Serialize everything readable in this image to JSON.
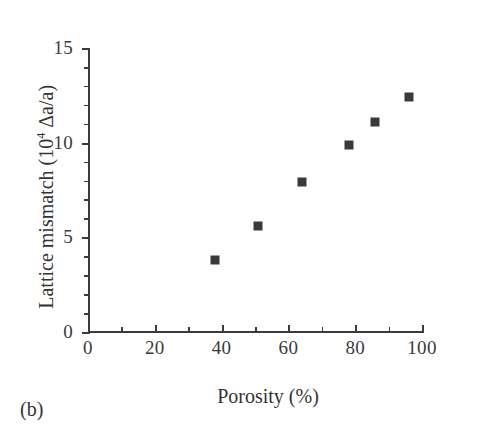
{
  "panel": {
    "label": "(b)"
  },
  "chart_data": {
    "type": "scatter",
    "title": "",
    "xlabel": "Porosity (%)",
    "ylabel": "Lattice mismatch (10⁴ Δa/a)",
    "ylabel_prefix": "Lattice mismatch (10",
    "ylabel_exponent": "4",
    "ylabel_suffix": " Δa/a)",
    "xlim": [
      0,
      100
    ],
    "ylim": [
      0,
      15
    ],
    "x_major_ticks": [
      0,
      20,
      40,
      60,
      80,
      100
    ],
    "x_minor_step": 10,
    "y_major_ticks": [
      0,
      5,
      10,
      15
    ],
    "y_minor_step": 1,
    "x_tick_labels": [
      "0",
      "20",
      "40",
      "60",
      "80",
      "100"
    ],
    "y_tick_labels": [
      "0",
      "5",
      "10",
      "15"
    ],
    "grid": false,
    "legend": null,
    "marker": "square",
    "marker_color": "#3a3a3a",
    "axis_color": "#3b3b3b",
    "x": [
      38,
      51,
      64,
      78,
      86,
      96
    ],
    "y": [
      3.8,
      5.6,
      7.9,
      9.9,
      11.1,
      12.4
    ],
    "points": [
      {
        "x": 38,
        "y": 3.8
      },
      {
        "x": 51,
        "y": 5.6
      },
      {
        "x": 64,
        "y": 7.9
      },
      {
        "x": 78,
        "y": 9.9
      },
      {
        "x": 86,
        "y": 11.1
      },
      {
        "x": 96,
        "y": 12.4
      }
    ]
  }
}
